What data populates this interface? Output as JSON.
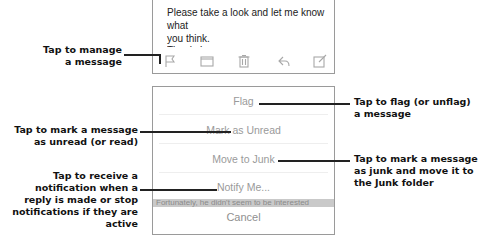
{
  "email": {
    "body_line1": "Please take a look and let me know what",
    "body_line2": "you think.",
    "body_line3": "Thanks!"
  },
  "toolbar": {
    "icons": [
      {
        "name": "flag-icon"
      },
      {
        "name": "folder-icon"
      },
      {
        "name": "trash-icon"
      },
      {
        "name": "reply-icon"
      },
      {
        "name": "compose-icon"
      }
    ]
  },
  "action_sheet": {
    "items": [
      {
        "label": "Flag"
      },
      {
        "label": "Mark as Unread"
      },
      {
        "label": "Move to Junk"
      },
      {
        "label": "Notify Me..."
      }
    ],
    "background_text": "Fortunately, he didn't seem to be interested",
    "cancel_label": "Cancel"
  },
  "callouts": {
    "manage": "Tap to manage\na message",
    "flag": "Tap to flag (or unflag)\na message",
    "unread": "Tap to mark a message\nas unread (or read)",
    "junk": "Tap to mark a message\nas junk and move it to\nthe Junk folder",
    "notify": "Tap to receive a\nnotification when a\nreply is made or stop\nnotifications if they are\nactive"
  }
}
